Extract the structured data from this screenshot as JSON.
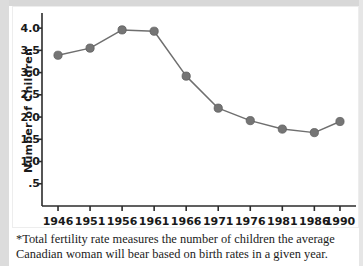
{
  "chart_data": {
    "type": "line",
    "title": "",
    "subtitle": "",
    "xlabel": "",
    "ylabel": "Number of Children",
    "categories": [
      "1946",
      "1951",
      "1956",
      "1961",
      "1966",
      "1971",
      "1976",
      "1981",
      "1986",
      "1990"
    ],
    "x": [
      1946,
      1951,
      1956,
      1961,
      1966,
      1971,
      1976,
      1981,
      1986,
      1990
    ],
    "values": [
      3.39,
      3.55,
      3.96,
      3.93,
      2.92,
      2.2,
      1.92,
      1.73,
      1.65,
      1.9
    ],
    "series": [
      {
        "name": "Total fertility rate",
        "values": [
          3.39,
          3.55,
          3.96,
          3.93,
          2.92,
          2.2,
          1.92,
          1.73,
          1.65,
          1.9
        ]
      }
    ],
    "ylim": [
      0,
      4.25
    ],
    "xlim": [
      1943.5,
      1992.5
    ],
    "yticks": [
      0.5,
      1.0,
      1.5,
      2.0,
      2.5,
      3.0,
      3.5,
      4.0
    ],
    "ytick_labels": [
      ".5",
      "1.0",
      "1.5",
      "2.0",
      "2.5",
      "3.0",
      "3.5",
      "4.0"
    ],
    "xticks": [
      1946,
      1951,
      1956,
      1961,
      1966,
      1971,
      1976,
      1981,
      1986,
      1990
    ],
    "xtick_labels": [
      "1946",
      "1951",
      "1956",
      "1961",
      "1966",
      "1971",
      "1976",
      "1981",
      "1986",
      "1990"
    ],
    "grid": false,
    "legend": false,
    "legend_position": "none",
    "marker": "circle",
    "annotations": []
  },
  "colors": {
    "line": "#6f6f6f",
    "marker": "#757575",
    "marker_edge": "#5e5e5e",
    "axis": "#2b2b2b",
    "text": "#1a1a1a",
    "background": "#ffffff",
    "frame_border": "#ededed",
    "scan_edge": "#dcdcdc"
  },
  "footnote": {
    "text": "*Total fertility rate measures the number of children the average Canadian woman will bear based on birth rates in a given year."
  }
}
